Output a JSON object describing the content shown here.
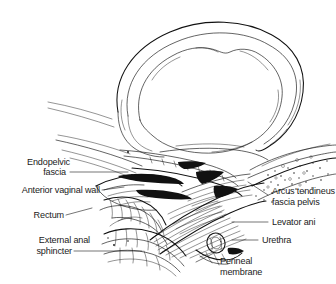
{
  "figure": {
    "type": "anatomical-line-drawing",
    "background_color": "#ffffff",
    "ink_color": "#111111",
    "label_color": "#1a1a1a"
  },
  "labels": {
    "endopelvic_fascia_line1": "Endopelvic",
    "endopelvic_fascia_line2": "fascia",
    "anterior_vaginal_wall": "Anterior vaginal wall",
    "rectum": "Rectum",
    "external_anal_sphincter_line1": "External anal",
    "external_anal_sphincter_line2": "sphincter",
    "arcus_tendineus_line1": "Arcus tendineus",
    "arcus_tendineus_line2": "fascia pelvis",
    "levator_ani": "Levator ani",
    "urethra": "Urethra",
    "perineal_membrane_line1": "Perineal",
    "perineal_membrane_line2": "membrane"
  },
  "structures": [
    {
      "name": "pelvic-brim-ring",
      "side": "superior",
      "label": null
    },
    {
      "name": "endopelvic-fascia",
      "side": "left",
      "label": "Endopelvic fascia"
    },
    {
      "name": "anterior-vaginal-wall",
      "side": "left",
      "label": "Anterior vaginal wall"
    },
    {
      "name": "rectum",
      "side": "left",
      "label": "Rectum"
    },
    {
      "name": "external-anal-sphincter",
      "side": "left",
      "label": "External anal sphincter"
    },
    {
      "name": "arcus-tendineus-fascia-pelvis",
      "side": "right",
      "label": "Arcus tendineus fascia pelvis"
    },
    {
      "name": "levator-ani",
      "side": "right",
      "label": "Levator ani"
    },
    {
      "name": "urethra",
      "side": "right",
      "label": "Urethra"
    },
    {
      "name": "perineal-membrane",
      "side": "right",
      "label": "Perineal membrane"
    }
  ]
}
